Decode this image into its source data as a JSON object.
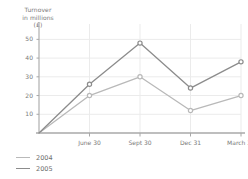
{
  "chart_data": {
    "type": "line",
    "title": "",
    "ylabel_lines": [
      "Turnover",
      "in millions",
      "(£)"
    ],
    "xlabel": "",
    "categories": [
      "",
      "June 30",
      "Sept 30",
      "Dec 31",
      "March 31"
    ],
    "xtick_labels": [
      "June 30",
      "Sept 30",
      "Dec 31",
      "March 31"
    ],
    "ytick_labels": [
      "10",
      "20",
      "30",
      "40",
      "50"
    ],
    "ytick_values": [
      10,
      20,
      30,
      40,
      50
    ],
    "ylim": [
      0,
      55
    ],
    "grid": "horizontal-and-vertical",
    "legend_position": "bottom-left",
    "markers": "open-circle",
    "series": [
      {
        "name": "2004",
        "color": "#b9b9b9",
        "values": [
          0,
          20,
          30,
          12,
          20
        ]
      },
      {
        "name": "2005",
        "color": "#8c8c8c",
        "values": [
          0,
          26,
          48,
          24,
          38
        ]
      }
    ]
  },
  "legend": {
    "entries": [
      {
        "label": "2004",
        "color": "#b9b9b9"
      },
      {
        "label": "2005",
        "color": "#8c8c8c"
      }
    ]
  },
  "colors": {
    "series_2004": "#b9b9b9",
    "series_2005": "#8c8c8c",
    "grid": "#ebebeb",
    "axis": "#a8a8a8",
    "text": "#7a7a7a"
  }
}
